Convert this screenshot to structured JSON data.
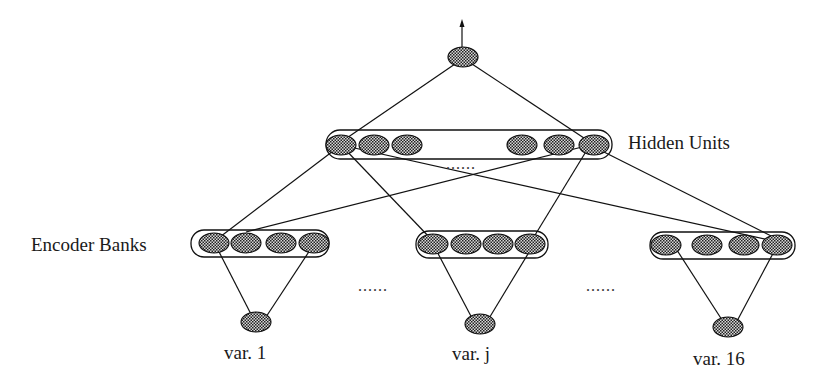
{
  "diagram": {
    "type": "neural-network-architecture",
    "labels": {
      "hidden_units": "Hidden Units",
      "encoder_banks": "Encoder Banks",
      "var1": "var. 1",
      "varj": "var. j",
      "var16": "var. 16",
      "ellipsis_hidden": "......",
      "ellipsis_left": "......",
      "ellipsis_right": "......"
    },
    "layers": [
      {
        "name": "output",
        "units": 1
      },
      {
        "name": "hidden",
        "units_shown": 6,
        "label": "Hidden Units"
      },
      {
        "name": "encoder_banks",
        "banks_shown": 3,
        "units_per_bank": 4,
        "label": "Encoder Banks"
      },
      {
        "name": "inputs",
        "units_shown": 3,
        "labels": [
          "var. 1",
          "var. j",
          "var. 16"
        ]
      }
    ],
    "colors": {
      "stroke": "#111111",
      "node_fill": "#555555",
      "background": "#ffffff"
    }
  }
}
